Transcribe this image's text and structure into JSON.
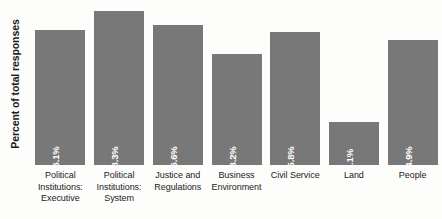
{
  "chart_data": {
    "type": "bar",
    "title": "",
    "subtitle": "",
    "xlabel": "",
    "ylabel": "Percent of total responses",
    "ylim": [
      0,
      20
    ],
    "grid": false,
    "legend": null,
    "bar_color": "#787878",
    "background_color": "#fdfdfb",
    "value_label_color": "#ffffff",
    "value_label_orientation": "vertical",
    "categories": [
      "Political Institutions: Executive",
      "Political Institutions: System",
      "Justice and Regulations",
      "Business Environment",
      "Civil Service",
      "Land",
      "People"
    ],
    "category_lines": [
      [
        "Political",
        "Institutions:",
        "Executive"
      ],
      [
        "Political",
        "Institutions:",
        "System"
      ],
      [
        "Justice and",
        "Regulations"
      ],
      [
        "Business",
        "Environment"
      ],
      [
        "Civil Service"
      ],
      [
        "Land"
      ],
      [
        "People"
      ]
    ],
    "values": [
      16.1,
      18.3,
      16.6,
      13.2,
      15.8,
      5.1,
      14.9
    ],
    "value_labels": [
      "16.1%",
      "18.3%",
      "16.6%",
      "13.2%",
      "15.8%",
      "5.1%",
      "14.9%"
    ]
  }
}
